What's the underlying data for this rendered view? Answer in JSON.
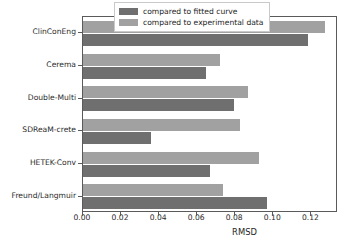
{
  "chart_data": {
    "type": "bar",
    "orientation": "horizontal",
    "title": "",
    "xlabel": "RMSD",
    "ylabel": "",
    "xlim": [
      0.0,
      0.134
    ],
    "ylim": [
      0,
      6
    ],
    "grid": false,
    "legend_position": "upper right",
    "xticks": [
      "0.00",
      "0.02",
      "0.04",
      "0.06",
      "0.08",
      "0.10",
      "0.12"
    ],
    "xtick_values": [
      0.0,
      0.02,
      0.04,
      0.06,
      0.08,
      0.1,
      0.12
    ],
    "categories": [
      "ClinConEng",
      "Cerema",
      "Double-Multi",
      "SDReaM-crete",
      "HETEK-Conv",
      "Freund/Langmuir"
    ],
    "series": [
      {
        "name": "compared to fitted curve",
        "color": "#6f6f6f",
        "values": [
          0.118,
          0.0645,
          0.0795,
          0.0355,
          0.0665,
          0.0965
        ]
      },
      {
        "name": "compared to experimental data",
        "color": "#a1a1a1",
        "values": [
          0.127,
          0.0718,
          0.0865,
          0.0825,
          0.0925,
          0.0735
        ]
      }
    ]
  },
  "legend": {
    "entries": [
      {
        "label": "compared to fitted curve",
        "swatch": "dark"
      },
      {
        "label": "compared to experimental data",
        "swatch": "light"
      }
    ]
  },
  "axis": {
    "x_label": "RMSD"
  },
  "colors": {
    "dark_bar": "#6f6f6f",
    "light_bar": "#a1a1a1",
    "axis": "#5a5a5a",
    "text": "#1e1e1e",
    "background": "#ffffff"
  }
}
